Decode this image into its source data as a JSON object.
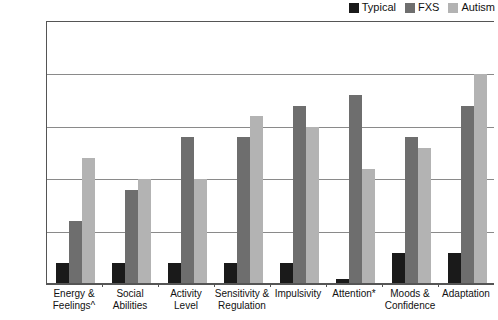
{
  "chart_data": {
    "type": "bar",
    "title": "",
    "xlabel": "",
    "ylabel": "Z Score",
    "ylim": [
      -2.5,
      0
    ],
    "yticks": [
      0,
      -0.5,
      -1,
      -1.5,
      -2,
      -2.5
    ],
    "ytick_labels": [
      "0",
      "-0.5",
      "-1",
      "-1.5",
      "-2",
      "-2.5"
    ],
    "grid": true,
    "legend_position": "top-right",
    "categories": [
      "Energy &\nFeelings^",
      "Social\nAbilities",
      "Activity\nLevel",
      "Sensitivity &\nRegulation",
      "Impulsivity",
      "Attention*",
      "Moods &\nConfidence",
      "Adaptation"
    ],
    "category_lines": [
      [
        "Energy &",
        "Feelings^"
      ],
      [
        "Social",
        "Abilities"
      ],
      [
        "Activity",
        "Level"
      ],
      [
        "Sensitivity &",
        "Regulation"
      ],
      [
        "Impulsivity",
        ""
      ],
      [
        "Attention*",
        ""
      ],
      [
        "Moods &",
        "Confidence"
      ],
      [
        "Adaptation",
        ""
      ]
    ],
    "series": [
      {
        "name": "Typical",
        "color": "#1a1a1a",
        "values": [
          -0.2,
          -0.2,
          -0.2,
          -0.2,
          -0.2,
          -0.05,
          -0.3,
          -0.3
        ]
      },
      {
        "name": "FXS",
        "color": "#6e6e6e",
        "values": [
          -0.6,
          -0.9,
          -1.4,
          -1.4,
          -1.7,
          -1.8,
          -1.4,
          -1.7
        ]
      },
      {
        "name": "Autism",
        "color": "#b3b3b3",
        "values": [
          -1.2,
          -1.0,
          -1.0,
          -1.6,
          -1.5,
          -1.1,
          -1.3,
          -2.0
        ]
      }
    ]
  },
  "legend": {
    "items": [
      {
        "label": "Typical",
        "color": "#1a1a1a"
      },
      {
        "label": "FXS",
        "color": "#6e6e6e"
      },
      {
        "label": "Autism",
        "color": "#b3b3b3"
      }
    ]
  }
}
